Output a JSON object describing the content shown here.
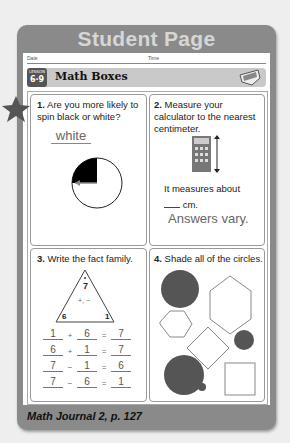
{
  "header": {
    "title": "Student Page",
    "date_label": "Date",
    "time_label": "Time"
  },
  "lesson_bar": {
    "lesson_label": "LESSON",
    "lesson_number": "6·9",
    "title": "Math Boxes",
    "icon": "math-boxes-icon"
  },
  "boxes": [
    {
      "number": "1.",
      "question": "Are you more likely to spin black or white?",
      "answer": "white",
      "icon": "star-icon"
    },
    {
      "number": "2.",
      "question": "Measure your calculator to the nearest centimeter.",
      "measure_text": "It measures about",
      "blank_unit": "cm.",
      "answer": "Answers vary."
    },
    {
      "number": "3.",
      "question": "Write the fact family.",
      "triangle": {
        "top": "7",
        "left": "6",
        "right": "1",
        "ops": "+, −"
      },
      "equations": [
        {
          "a": "1",
          "op": "+",
          "b": "6",
          "eq": "=",
          "c": "7"
        },
        {
          "a": "6",
          "op": "+",
          "b": "1",
          "eq": "=",
          "c": "7"
        },
        {
          "a": "7",
          "op": "−",
          "b": "1",
          "eq": "=",
          "c": "6"
        },
        {
          "a": "7",
          "op": "−",
          "b": "6",
          "eq": "=",
          "c": "1"
        }
      ]
    },
    {
      "number": "4.",
      "question": "Shade all of the circles."
    }
  ],
  "footer": {
    "text": "Math Journal 2, p. 127"
  }
}
